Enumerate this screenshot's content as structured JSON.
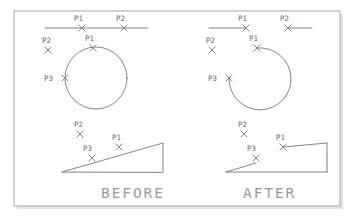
{
  "figure": {
    "background_color": "#ffffff",
    "border_color": "#b4b4b4",
    "geometry_color": "#6e6e74",
    "label_color": "#66666c",
    "caption_color": "#9a9aa0",
    "frame": {
      "x": 14,
      "y": 11,
      "width": 326,
      "height": 195
    }
  },
  "panels": {
    "before": {
      "caption": "BEFORE",
      "caption_x": 101,
      "caption_y": 198,
      "rows": [
        {
          "name": "line-row",
          "shape": "full-line",
          "points": [
            {
              "label": "P1",
              "label_x": 74,
              "label_y": 21,
              "mark_x": 82,
              "mark_y": 28
            },
            {
              "label": "P2",
              "label_x": 116,
              "label_y": 21,
              "mark_x": 124,
              "mark_y": 28
            }
          ]
        },
        {
          "name": "circle-row",
          "shape": "full-circle",
          "points": [
            {
              "label": "P2",
              "label_x": 42,
              "label_y": 43,
              "mark_x": 48,
              "mark_y": 50
            },
            {
              "label": "P1",
              "label_x": 85,
              "label_y": 41,
              "mark_x": 93,
              "mark_y": 48
            },
            {
              "label": "P3",
              "label_x": 44,
              "label_y": 81,
              "mark_x": 65,
              "mark_y": 78
            }
          ]
        },
        {
          "name": "triangle-row",
          "shape": "full-triangle",
          "points": [
            {
              "label": "P2",
              "label_x": 74,
              "label_y": 127,
              "mark_x": 80,
              "mark_y": 134
            },
            {
              "label": "P1",
              "label_x": 112,
              "label_y": 140,
              "mark_x": 119,
              "mark_y": 147
            },
            {
              "label": "P3",
              "label_x": 83,
              "label_y": 151,
              "mark_x": 92,
              "mark_y": 158
            }
          ]
        }
      ]
    },
    "after": {
      "caption": "AFTER",
      "caption_x": 243,
      "caption_y": 198,
      "rows": [
        {
          "name": "line-row",
          "shape": "trimmed-line",
          "points": [
            {
              "label": "P1",
              "label_x": 238,
              "label_y": 21,
              "mark_x": 246,
              "mark_y": 28
            },
            {
              "label": "P2",
              "label_x": 280,
              "label_y": 21,
              "mark_x": 288,
              "mark_y": 28
            }
          ]
        },
        {
          "name": "circle-row",
          "shape": "trimmed-arc",
          "points": [
            {
              "label": "P2",
              "label_x": 206,
              "label_y": 43,
              "mark_x": 212,
              "mark_y": 50
            },
            {
              "label": "P1",
              "label_x": 249,
              "label_y": 41,
              "mark_x": 257,
              "mark_y": 48
            },
            {
              "label": "P3",
              "label_x": 208,
              "label_y": 81,
              "mark_x": 229,
              "mark_y": 78
            }
          ]
        },
        {
          "name": "triangle-row",
          "shape": "trimmed-triangle",
          "points": [
            {
              "label": "P2",
              "label_x": 238,
              "label_y": 127,
              "mark_x": 244,
              "mark_y": 134
            },
            {
              "label": "P1",
              "label_x": 276,
              "label_y": 140,
              "mark_x": 283,
              "mark_y": 147
            },
            {
              "label": "P3",
              "label_x": 247,
              "label_y": 151,
              "mark_x": 256,
              "mark_y": 158
            }
          ]
        }
      ]
    }
  },
  "geometry_paths": {
    "before_line": "M45,28 L148,28",
    "after_line_left": "M209,28 L246,28",
    "after_line_right": "M288,28 L312,28",
    "before_circle": {
      "cx": 96,
      "cy": 78,
      "r": 31
    },
    "after_arc": "M257,48 A31,31 0 1 1 229,78",
    "before_triangle": "M62,172 L163,143 L163,172 Z",
    "after_triangle": "M226,172 L256,163 M283,147 L327,143 L327,172 L226,172",
    "after_tri_hyp_left": "M226,172 L256,163",
    "after_tri_hyp_right": "M283,147 L327,143",
    "after_tri_vert": "M327,143 L327,172",
    "after_tri_base": "M226,172 L327,172"
  }
}
